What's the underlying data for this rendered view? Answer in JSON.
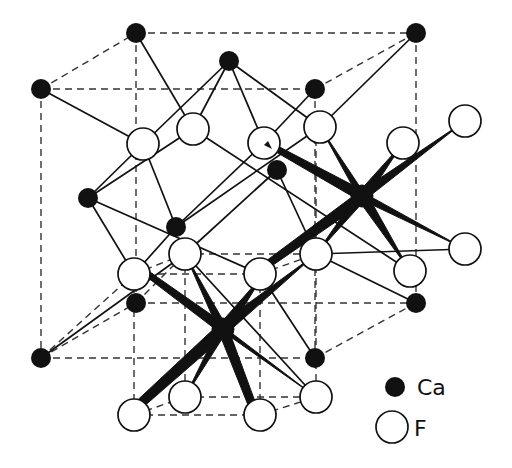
{
  "diagram": {
    "colors": {
      "ca_fill": "#111111",
      "f_fill": "#ffffff",
      "stroke": "#111111",
      "dash": "#333333"
    },
    "legend": [
      {
        "symbol": "filled-circle",
        "label": "Ca"
      },
      {
        "symbol": "open-circle",
        "label": "F"
      }
    ],
    "ca_atoms": [
      {
        "x": 136,
        "y": 33
      },
      {
        "x": 416,
        "y": 33
      },
      {
        "x": 41,
        "y": 89
      },
      {
        "x": 315,
        "y": 89
      },
      {
        "x": 229,
        "y": 61
      },
      {
        "x": 88,
        "y": 198
      },
      {
        "x": 176,
        "y": 227
      },
      {
        "x": 277,
        "y": 170
      },
      {
        "x": 362,
        "y": 196
      },
      {
        "x": 136,
        "y": 303
      },
      {
        "x": 416,
        "y": 303
      },
      {
        "x": 41,
        "y": 358
      },
      {
        "x": 315,
        "y": 358
      },
      {
        "x": 223,
        "y": 329
      }
    ],
    "f_atoms": [
      {
        "x": 143,
        "y": 144
      },
      {
        "x": 193,
        "y": 129
      },
      {
        "x": 264,
        "y": 143
      },
      {
        "x": 320,
        "y": 127
      },
      {
        "x": 403,
        "y": 143
      },
      {
        "x": 465,
        "y": 121
      },
      {
        "x": 134,
        "y": 274
      },
      {
        "x": 185,
        "y": 254
      },
      {
        "x": 260,
        "y": 274
      },
      {
        "x": 316,
        "y": 254
      },
      {
        "x": 410,
        "y": 271
      },
      {
        "x": 465,
        "y": 249
      },
      {
        "x": 134,
        "y": 415
      },
      {
        "x": 185,
        "y": 397
      },
      {
        "x": 260,
        "y": 415
      },
      {
        "x": 316,
        "y": 397
      }
    ]
  }
}
